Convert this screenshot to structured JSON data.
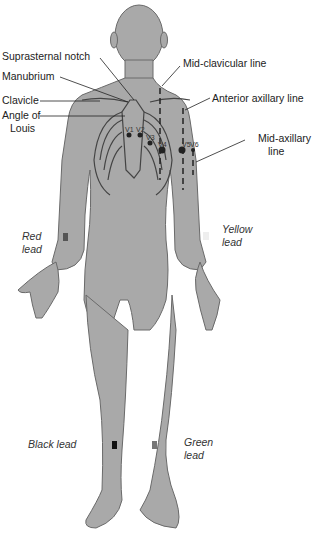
{
  "diagram": {
    "colors": {
      "body_fill": "#a9a9a9",
      "body_stroke": "#6a6a6a",
      "line": "#222222",
      "red_lead_marker": "#555555",
      "yellow_lead_marker": "#eeeeee",
      "black_lead_marker": "#111111",
      "green_lead_marker": "#777777"
    },
    "anatomy_labels": {
      "suprasternal_notch": "Suprasternal notch",
      "manubrium": "Manubrium",
      "clavicle": "Clavicle",
      "angle_of_louis_1": "Angle of",
      "angle_of_louis_2": "Louis",
      "mid_clavicular": "Mid-clavicular line",
      "anterior_axillary": "Anterior axillary line",
      "mid_axillary_1": "Mid-axillary",
      "mid_axillary_2": "line"
    },
    "chest_leads": [
      "V1",
      "V2",
      "V3",
      "V4",
      "V5",
      "V6"
    ],
    "limb_leads": {
      "red_1": "Red",
      "red_2": "lead",
      "yellow_1": "Yellow",
      "yellow_2": "lead",
      "black": "Black lead",
      "green_1": "Green",
      "green_2": "lead"
    }
  }
}
